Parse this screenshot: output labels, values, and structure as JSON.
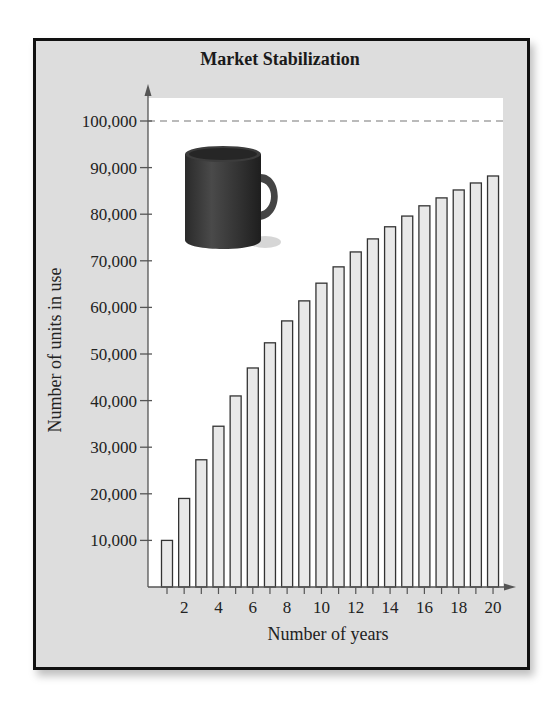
{
  "chart_data": {
    "type": "bar",
    "title": "Market Stabilization",
    "xlabel": "Number of years",
    "ylabel": "Number of units in use",
    "categories": [
      1,
      2,
      3,
      4,
      5,
      6,
      7,
      8,
      9,
      10,
      11,
      12,
      13,
      14,
      15,
      16,
      17,
      18,
      19,
      20
    ],
    "values": [
      10000,
      19000,
      27300,
      34500,
      41000,
      47000,
      52400,
      57100,
      61400,
      65200,
      68700,
      71900,
      74700,
      77300,
      79600,
      81800,
      83500,
      85200,
      86700,
      88200
    ],
    "ylim": [
      0,
      100000
    ],
    "xlim": [
      0,
      20.5
    ],
    "yticks": [
      10000,
      20000,
      30000,
      40000,
      50000,
      60000,
      70000,
      80000,
      90000,
      100000
    ],
    "ytick_labels": [
      "10,000",
      "20,000",
      "30,000",
      "40,000",
      "50,000",
      "60,000",
      "70,000",
      "80,000",
      "90,000",
      "100,000"
    ],
    "xticks_labeled": [
      2,
      4,
      6,
      8,
      10,
      12,
      14,
      16,
      18,
      20
    ],
    "xtick_labels": [
      "2",
      "4",
      "6",
      "8",
      "10",
      "12",
      "14",
      "16",
      "18",
      "20"
    ],
    "annotations": [
      {
        "type": "horizontal-dashed-line",
        "y": 100000,
        "meaning": "saturation limit"
      },
      {
        "type": "image",
        "depicts": "coffee-mug"
      }
    ],
    "grid": false,
    "legend": null
  },
  "colors": {
    "frame_background": "#dddddd",
    "plot_background": "#ffffff",
    "bar_fill": "#e8e8e8",
    "bar_stroke": "#333333",
    "axis": "#555555",
    "mug": "#3a3a3a"
  }
}
